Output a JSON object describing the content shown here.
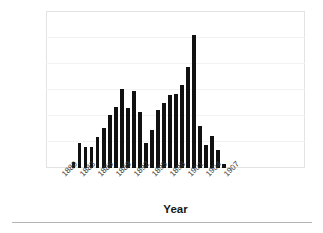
{
  "chart_data": {
    "type": "bar",
    "title": "",
    "xlabel": "Year",
    "ylabel": "Number (million)",
    "grid": true,
    "legend": "none",
    "ylim": [
      0,
      6
    ],
    "categories": [
      1880,
      1881,
      1882,
      1883,
      1884,
      1885,
      1886,
      1887,
      1888,
      1889,
      1890,
      1891,
      1892,
      1893,
      1894,
      1895,
      1896,
      1897,
      1898,
      1899,
      1900,
      1901,
      1902,
      1903,
      1904,
      1905,
      1906,
      1907,
      1908
    ],
    "values": [
      0,
      0,
      0.25,
      0.95,
      0.8,
      0.8,
      1.2,
      1.55,
      2.05,
      2.35,
      3.05,
      2.3,
      2.95,
      2.15,
      0.95,
      1.45,
      2.25,
      2.5,
      2.8,
      2.85,
      3.2,
      3.9,
      5.1,
      1.6,
      0.9,
      1.25,
      0.7,
      0.15,
      0
    ],
    "tick_labels": [
      "1880",
      "1883",
      "1886",
      "1889",
      "1892",
      "1895",
      "1898",
      "1901",
      "1904",
      "1907"
    ],
    "tick_years": [
      1880,
      1883,
      1886,
      1889,
      1892,
      1895,
      1898,
      1901,
      1904,
      1907
    ],
    "gridline_values": [
      1,
      2,
      3,
      4,
      5
    ],
    "bar_color": "#111111",
    "grid_color": "#f2f2f2",
    "frame_color": "#e3e3e3"
  }
}
